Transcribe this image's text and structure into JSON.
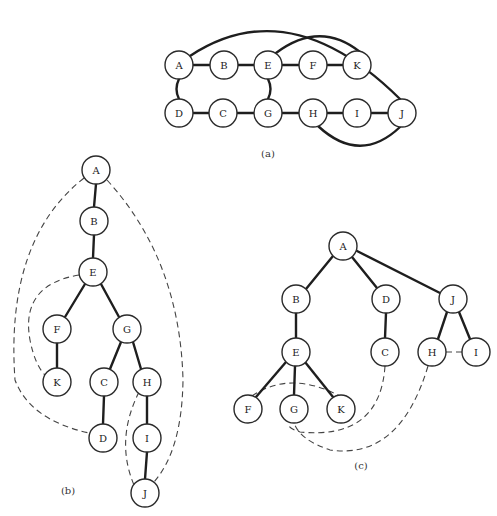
{
  "figure": {
    "node_radius": 14,
    "panels": [
      {
        "id": "a",
        "caption": "(a)",
        "caption_pos": [
          268,
          157
        ],
        "nodes": [
          {
            "label": "A",
            "x": 179,
            "y": 65
          },
          {
            "label": "B",
            "x": 224,
            "y": 65
          },
          {
            "label": "E",
            "x": 268,
            "y": 65
          },
          {
            "label": "F",
            "x": 313,
            "y": 65
          },
          {
            "label": "K",
            "x": 357,
            "y": 65
          },
          {
            "label": "D",
            "x": 179,
            "y": 113
          },
          {
            "label": "C",
            "x": 223,
            "y": 113
          },
          {
            "label": "G",
            "x": 268,
            "y": 113
          },
          {
            "label": "H",
            "x": 313,
            "y": 113
          },
          {
            "label": "I",
            "x": 357,
            "y": 113
          },
          {
            "label": "J",
            "x": 402,
            "y": 113
          }
        ],
        "solid_edges": [
          "M193 65 L210 65",
          "M238 65 L254 65",
          "M282 65 L299 65",
          "M327 65 L343 65",
          "M193 113 L209 113",
          "M237 113 L254 113",
          "M282 113 L299 113",
          "M327 113 L343 113",
          "M371 113 L388 113",
          "M179 79 Q174 89 179 99",
          "M268 79 Q273 89 268 99",
          "M190 56 Q290 -10 400 99",
          "M276 53 Q320 20 360 52",
          "M318 126 Q360 165 400 127"
        ],
        "dashed_edges": []
      },
      {
        "id": "b",
        "caption": "(b)",
        "caption_pos": [
          68,
          494
        ],
        "nodes": [
          {
            "label": "A",
            "x": 96,
            "y": 170
          },
          {
            "label": "B",
            "x": 94,
            "y": 221
          },
          {
            "label": "E",
            "x": 93,
            "y": 272
          },
          {
            "label": "F",
            "x": 57,
            "y": 329
          },
          {
            "label": "G",
            "x": 127,
            "y": 329
          },
          {
            "label": "K",
            "x": 57,
            "y": 382
          },
          {
            "label": "C",
            "x": 104,
            "y": 382
          },
          {
            "label": "H",
            "x": 147,
            "y": 382
          },
          {
            "label": "D",
            "x": 103,
            "y": 438
          },
          {
            "label": "I",
            "x": 147,
            "y": 438
          },
          {
            "label": "J",
            "x": 145,
            "y": 493
          }
        ],
        "solid_edges": [
          "M96 184 L94 207",
          "M94 235 L93 258",
          "M85 284 L65 317",
          "M101 284 L119 317",
          "M57 343 L57 368",
          "M121 342 L110 369",
          "M133 342 L141 369",
          "M104 396 L103 424",
          "M147 396 L147 424",
          "M147 452 L145 479"
        ],
        "dashed_edges": [
          "M84 178 Q5 240 15 380 Q30 420 89 433",
          "M107 180 Q180 260 183 380 Q182 450 154 482",
          "M79 275 Q20 285 30 340 Q35 365 45 375",
          "M139 392 Q115 440 134 485"
        ]
      },
      {
        "id": "c",
        "caption": "(c)",
        "caption_pos": [
          361,
          469
        ],
        "nodes": [
          {
            "label": "A",
            "x": 343,
            "y": 246
          },
          {
            "label": "B",
            "x": 296,
            "y": 299
          },
          {
            "label": "D",
            "x": 386,
            "y": 299
          },
          {
            "label": "J",
            "x": 453,
            "y": 299
          },
          {
            "label": "E",
            "x": 296,
            "y": 352
          },
          {
            "label": "C",
            "x": 385,
            "y": 352
          },
          {
            "label": "H",
            "x": 432,
            "y": 352
          },
          {
            "label": "I",
            "x": 476,
            "y": 352
          },
          {
            "label": "F",
            "x": 248,
            "y": 409
          },
          {
            "label": "G",
            "x": 294,
            "y": 409
          },
          {
            "label": "K",
            "x": 341,
            "y": 409
          }
        ],
        "solid_edges": [
          "M333 256 L306 289",
          "M352 257 L377 288",
          "M357 251 L440 293",
          "M296 313 L296 338",
          "M386 313 L385 338",
          "M447 312 L438 339",
          "M459 312 L470 339",
          "M286 362 L256 397",
          "M295 366 L294 395",
          "M305 362 L333 397"
        ],
        "dashed_edges": [
          "M252 396 Q290 370 340 396",
          "M385 366 Q380 440 300 432 Q285 427 290 423",
          "M428 366 Q400 460 330 450 Q300 440 294 423",
          "M446 352 L462 352"
        ]
      }
    ]
  }
}
